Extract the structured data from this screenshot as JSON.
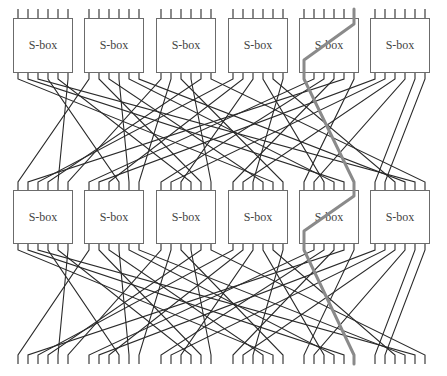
{
  "sbox_label": "S-box",
  "colors": {
    "wire": "#2a2a2a",
    "box_stroke": "#6b6b6b",
    "highlight": "#8a8a8a",
    "background": "#ffffff"
  },
  "layout": {
    "box_lefts": [
      13,
      84,
      156,
      228,
      299,
      370
    ],
    "box_width": 59,
    "bits_per_box": 6,
    "bit_pitch": 10,
    "bit_offset": 5,
    "rows": [
      {
        "box_top": 18,
        "box_bottom": 72
      },
      {
        "box_top": 190,
        "box_bottom": 243
      }
    ],
    "top_input_stub_top": 9,
    "stub_length": 7,
    "bottom_terminal_top": 355,
    "bottom_terminal_bottom": 364,
    "layer1_from_y": 79,
    "layer1_to_y": 182,
    "layer2_from_y": 250,
    "layer2_to_y": 355
  },
  "rounds": [
    {
      "name": "round-1",
      "sboxes": [
        "S-box",
        "S-box",
        "S-box",
        "S-box",
        "S-box",
        "S-box"
      ]
    },
    {
      "name": "round-2",
      "sboxes": [
        "S-box",
        "S-box",
        "S-box",
        "S-box",
        "S-box",
        "S-box"
      ]
    }
  ],
  "permutation": [
    22,
    28,
    34,
    9,
    15,
    4,
    0,
    16,
    21,
    10,
    27,
    33,
    5,
    11,
    23,
    17,
    3,
    35,
    2,
    8,
    14,
    26,
    32,
    20,
    29,
    6,
    12,
    18,
    1,
    24,
    7,
    13,
    19,
    25,
    30,
    31
  ],
  "highlight_path": {
    "description": "Single bit trail through S-box 5 in both rounds",
    "input_bit": 29,
    "round1_output_bit": 24,
    "round2_input_bit": 29,
    "round2_output_bit": 24,
    "final_bit": 29
  }
}
